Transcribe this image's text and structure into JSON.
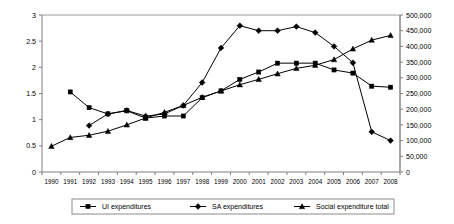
{
  "chart_data": {
    "type": "line",
    "title": "",
    "subtitle": "",
    "xlabel": "",
    "ylabel": "",
    "y2label": "",
    "grid": false,
    "legend_position": "bottom",
    "x": [
      1990,
      1991,
      1992,
      1993,
      1994,
      1995,
      1996,
      1997,
      1998,
      1999,
      2000,
      2001,
      2002,
      2003,
      2004,
      2005,
      2006,
      2007,
      2008
    ],
    "xtick_labels": [
      "1990",
      "1991",
      "1992",
      "1993",
      "1994",
      "1995",
      "1996",
      "1997",
      "1998",
      "1999",
      "2000",
      "2001",
      "2002",
      "2003",
      "2004",
      "2005",
      "2006",
      "2007",
      "2008"
    ],
    "ylim": [
      0,
      3
    ],
    "ytick_labels": [
      "0",
      "0.5",
      "1",
      "1.5",
      "2",
      "2.5",
      "3"
    ],
    "ytick_values": [
      0,
      0.5,
      1,
      1.5,
      2,
      2.5,
      3
    ],
    "y2lim": [
      0,
      500000
    ],
    "y2tick_labels": [
      "0",
      "50,000",
      "100,000",
      "150,000",
      "200,000",
      "250,000",
      "300,000",
      "350,000",
      "400,000",
      "450,000",
      "500,000"
    ],
    "y2tick_values": [
      0,
      50000,
      100000,
      150000,
      200000,
      250000,
      300000,
      350000,
      400000,
      450000,
      500000
    ],
    "series": [
      {
        "name": "UI expenditures",
        "axis": "left",
        "marker": "square",
        "color": "#000000",
        "x": [
          1991,
          1992,
          1993,
          1994,
          1995,
          1996,
          1997,
          1998,
          1999,
          2000,
          2001,
          2002,
          2003,
          2004,
          2005,
          2006,
          2007,
          2008
        ],
        "values": [
          1.53,
          1.23,
          1.11,
          1.17,
          1.03,
          1.07,
          1.07,
          1.42,
          1.55,
          1.77,
          1.91,
          2.08,
          2.08,
          2.08,
          1.95,
          1.89,
          1.64,
          1.62
        ]
      },
      {
        "name": "SA expenditures",
        "axis": "right",
        "marker": "diamond",
        "color": "#000000",
        "x": [
          1992,
          1993,
          1994,
          1995,
          1996,
          1997,
          1998,
          1999,
          2000,
          2001,
          2002,
          2003,
          2004,
          2005,
          2006,
          2007,
          2008
        ],
        "values": [
          148000,
          185000,
          196000,
          178000,
          185000,
          212000,
          285000,
          395000,
          466000,
          450000,
          450000,
          463000,
          444000,
          400000,
          348000,
          128000,
          100000
        ]
      },
      {
        "name": "Social expenditure total",
        "axis": "right",
        "marker": "triangle",
        "color": "#000000",
        "x": [
          1990,
          1991,
          1992,
          1993,
          1994,
          1995,
          1996,
          1997,
          1998,
          1999,
          2000,
          2001,
          2002,
          2003,
          2004,
          2005,
          2006,
          2007,
          2008
        ],
        "values": [
          82000,
          110000,
          117000,
          130000,
          150000,
          172000,
          190000,
          212000,
          238000,
          258000,
          278000,
          295000,
          313000,
          330000,
          340000,
          358000,
          392000,
          420000,
          435000
        ]
      }
    ]
  },
  "legend": {
    "items": [
      {
        "label": "UI expenditures",
        "marker": "square"
      },
      {
        "label": "SA expenditures",
        "marker": "diamond"
      },
      {
        "label": "Social expenditure total",
        "marker": "triangle"
      }
    ]
  }
}
